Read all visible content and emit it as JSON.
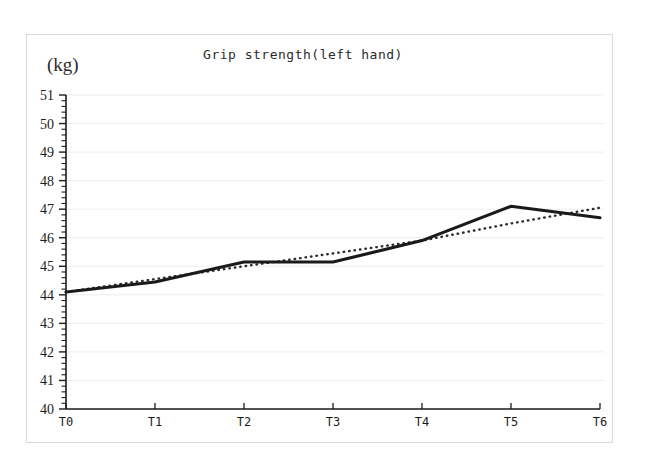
{
  "figure": {
    "unit_label": "(kg)",
    "background_color": "#ffffff",
    "frame_color": "#d9d9d9",
    "line_color": "#1a1a1a",
    "trend_color": "#2b2b2b",
    "grid_color": "#ededed",
    "axis_color": "#1c1c1c"
  },
  "chart_data": {
    "type": "line",
    "title": "Grip strength(left hand)",
    "xlabel": "",
    "ylabel": "(kg)",
    "categories": [
      "T0",
      "T1",
      "T2",
      "T3",
      "T4",
      "T5",
      "T6"
    ],
    "ylim": [
      40,
      51
    ],
    "yticks": [
      40,
      41,
      42,
      43,
      44,
      45,
      46,
      47,
      48,
      49,
      50,
      51
    ],
    "ytick_labels": [
      "40",
      "41",
      "42",
      "43",
      "44",
      "45",
      "46",
      "47",
      "48",
      "49",
      "50",
      "51"
    ],
    "minor_ticks_per_unit": 5,
    "grid": true,
    "grid_axis": "y",
    "legend": false,
    "legend_position": "none",
    "series": [
      {
        "name": "Grip strength (left hand)",
        "style": "solid",
        "values": [
          44.1,
          44.45,
          45.15,
          45.15,
          45.9,
          47.1,
          46.7
        ]
      },
      {
        "name": "Linear trend",
        "style": "dotted",
        "values": [
          44.1,
          44.55,
          45.0,
          45.45,
          45.9,
          46.5,
          47.05
        ]
      }
    ]
  }
}
